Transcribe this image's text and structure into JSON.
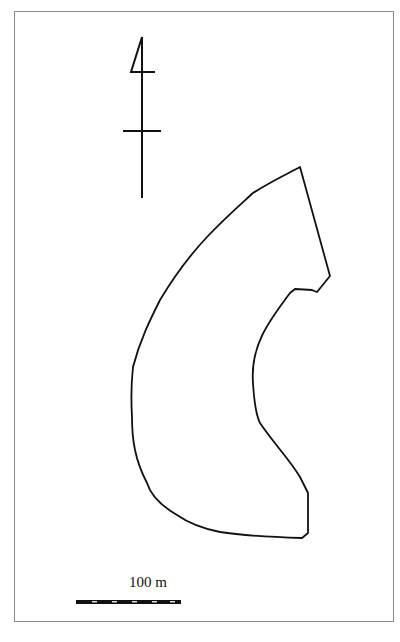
{
  "map": {
    "type": "site plan outline",
    "north_arrow": {
      "icon": "north-arrow-icon"
    },
    "scale_bar": {
      "label": "100 m",
      "length_px": 105
    },
    "outline_description": "Curved crescent-shaped site boundary"
  }
}
